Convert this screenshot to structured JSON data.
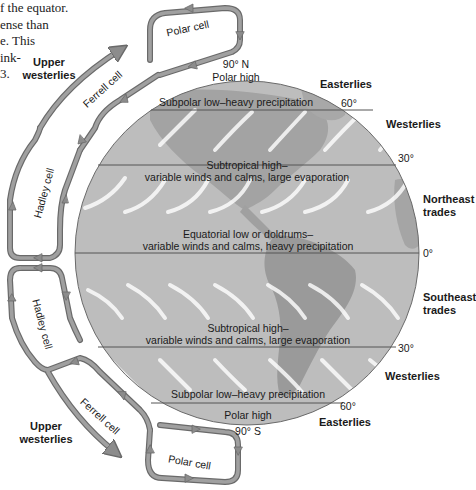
{
  "text_fragment": {
    "lines": [
      "f the equator.",
      "ense  than",
      "e. This",
      "ink-",
      "3."
    ]
  },
  "globe": {
    "poles": {
      "north": "90° N",
      "south": "90° S"
    },
    "zones": [
      {
        "id": "polar-high-n",
        "text": "Polar high"
      },
      {
        "id": "subpolar-low-n",
        "text": "Subpolar low–heavy precipitation"
      },
      {
        "id": "subtropical-high-n",
        "line1": "Subtropical high–",
        "line2": "variable winds and calms, large evaporation"
      },
      {
        "id": "equatorial-low",
        "line1": "Equatorial low or doldrums–",
        "line2": "variable winds and calms, heavy precipitation"
      },
      {
        "id": "subtropical-high-s",
        "line1": "Subtropical high–",
        "line2": "variable winds and calms, large evaporation"
      },
      {
        "id": "subpolar-low-s",
        "text": "Subpolar low–heavy precipitation"
      },
      {
        "id": "polar-high-s",
        "text": "Polar high"
      }
    ],
    "latitudes": {
      "n60": "60°",
      "n30": "30°",
      "eq": "0°",
      "s30": "30°",
      "s60": "60°"
    }
  },
  "winds": {
    "easterlies_n": "Easterlies",
    "westerlies_n": "Westerlies",
    "ne_trades": [
      "Northeast",
      "trades"
    ],
    "se_trades": [
      "Southeast",
      "trades"
    ],
    "westerlies_s": "Westerlies",
    "easterlies_s": "Easterlies"
  },
  "cells": {
    "polar_n": "Polar cell",
    "ferrell_n": "Ferrell cell",
    "hadley_n": "Hadley cell",
    "hadley_s": "Hadley cell",
    "ferrell_s": "Ferrell cell",
    "polar_s": "Polar cell"
  },
  "upper_westerlies": {
    "north": [
      "Upper",
      "westerlies"
    ],
    "south": [
      "Upper",
      "westerlies"
    ]
  },
  "colors": {
    "globe_fill": "#b9b9b9",
    "land": "#9a9a9a",
    "arrow": "#8c8c8c",
    "arrow_edge": "#6a6a6a",
    "line": "#555555",
    "text": "#1a1a1a"
  }
}
